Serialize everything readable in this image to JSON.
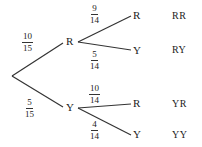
{
  "diagram": {
    "type": "probability-tree",
    "first_stage": {
      "R": {
        "label": "R",
        "prob": {
          "num": "10",
          "den": "15"
        }
      },
      "Y": {
        "label": "Y",
        "prob": {
          "num": "5",
          "den": "15"
        }
      }
    },
    "second_stage": {
      "R_R": {
        "label": "R",
        "prob": {
          "num": "9",
          "den": "14"
        }
      },
      "R_Y": {
        "label": "Y",
        "prob": {
          "num": "5",
          "den": "14"
        }
      },
      "Y_R": {
        "label": "R",
        "prob": {
          "num": "10",
          "den": "14"
        }
      },
      "Y_Y": {
        "label": "Y",
        "prob": {
          "num": "4",
          "den": "14"
        }
      }
    },
    "outcomes": [
      "RR",
      "RY",
      "YR",
      "YY"
    ],
    "line_color": "#333333"
  }
}
